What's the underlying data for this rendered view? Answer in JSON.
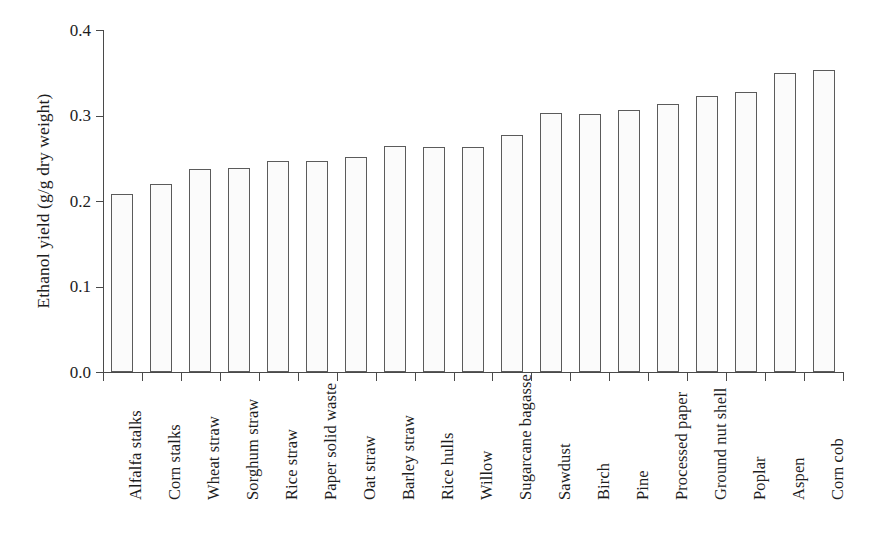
{
  "chart_data": {
    "type": "bar",
    "title": "",
    "xlabel": "",
    "ylabel": "Ethanol yield (g/g dry weight)",
    "ylim": [
      0.0,
      0.4
    ],
    "ytick_labels": [
      "0.0",
      "0.1",
      "0.2",
      "0.3",
      "0.4"
    ],
    "ytick_values": [
      0.0,
      0.1,
      0.2,
      0.3,
      0.4
    ],
    "grid": false,
    "legend": null,
    "orientation": "vertical",
    "categories": [
      "Alfalfa stalks",
      "Corn stalks",
      "Wheat straw",
      "Sorghum straw",
      "Rice straw",
      "Paper solid waste",
      "Oat straw",
      "Barley straw",
      "Rice hulls",
      "Willow",
      "Sugarcane bagasse",
      "Sawdust",
      "Birch",
      "Pine",
      "Processed paper",
      "Ground nut shell",
      "Poplar",
      "Aspen",
      "Corn cob"
    ],
    "values": [
      0.208,
      0.22,
      0.238,
      0.239,
      0.247,
      0.247,
      0.252,
      0.264,
      0.263,
      0.263,
      0.277,
      0.303,
      0.302,
      0.307,
      0.313,
      0.323,
      0.328,
      0.35,
      0.353
    ],
    "bar_fill": "#fbfbfb",
    "bar_edge": "#5b5b5b",
    "axis_color": "#4a4a4a"
  }
}
